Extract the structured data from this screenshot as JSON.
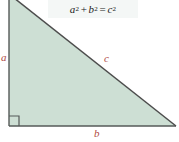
{
  "figure": {
    "equation": {
      "base_a": "a",
      "exp_a": "2",
      "plus": "+",
      "base_b": "b",
      "exp_b": "2",
      "equals": "=",
      "base_c": "c",
      "exp_c": "2",
      "full_text": "a2 + b2 = c2"
    },
    "labels": {
      "leg_vertical": "a",
      "hypotenuse": "c",
      "leg_horizontal": "b"
    },
    "right_angle_marker": "right-angle-square",
    "colors": {
      "fill": "#cddfd4",
      "stroke": "#4d4d4d",
      "label": "#b04a42",
      "equation_text": "#1a1a1a",
      "equation_background": "#f4f7f6",
      "page_background": "#ffffff"
    },
    "geometry": {
      "apex_top": [
        9,
        0
      ],
      "right_angle_vertex": [
        9,
        126
      ],
      "bottom_right_vertex": [
        176,
        126
      ]
    }
  }
}
